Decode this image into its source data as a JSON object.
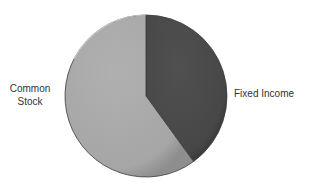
{
  "chart_data": {
    "type": "pie",
    "title": "",
    "categories": [
      "Fixed Income",
      "Common Stock"
    ],
    "values": [
      40,
      60
    ],
    "units": "percent (estimated from slice angles)",
    "colors": [
      "#4a4a4a",
      "#a9a9a9"
    ],
    "start_angle_deg": 0,
    "direction": "clockwise",
    "legend": "none (direct labels)",
    "labels": {
      "fixed_income": "Fixed Income",
      "common_stock_line1": "Common",
      "common_stock_line2": "Stock"
    }
  }
}
